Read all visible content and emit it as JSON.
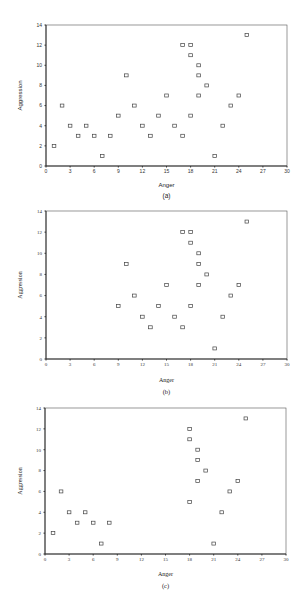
{
  "chart_data": [
    {
      "type": "scatter",
      "caption": "(a)",
      "title": "",
      "xlabel": "Anger",
      "ylabel": "Aggression",
      "xlim": [
        0,
        30
      ],
      "ylim": [
        0,
        14
      ],
      "xticks": [
        0,
        3,
        6,
        9,
        12,
        15,
        18,
        21,
        24,
        27,
        30
      ],
      "yticks": [
        0,
        2,
        4,
        6,
        8,
        10,
        12,
        14
      ],
      "grid": false,
      "marker": "open-square",
      "points": [
        [
          1,
          2
        ],
        [
          2,
          6
        ],
        [
          3,
          4
        ],
        [
          4,
          3
        ],
        [
          5,
          4
        ],
        [
          6,
          3
        ],
        [
          7,
          1
        ],
        [
          8,
          3
        ],
        [
          9,
          5
        ],
        [
          10,
          9
        ],
        [
          11,
          6
        ],
        [
          12,
          4
        ],
        [
          13,
          3
        ],
        [
          14,
          5
        ],
        [
          15,
          7
        ],
        [
          16,
          4
        ],
        [
          17,
          3
        ],
        [
          17,
          12
        ],
        [
          18,
          12
        ],
        [
          18,
          11
        ],
        [
          18,
          5
        ],
        [
          19,
          10
        ],
        [
          19,
          9
        ],
        [
          19,
          7
        ],
        [
          20,
          8
        ],
        [
          21,
          1
        ],
        [
          22,
          4
        ],
        [
          23,
          6
        ],
        [
          24,
          7
        ],
        [
          25,
          13
        ]
      ]
    },
    {
      "type": "scatter",
      "caption": "(b)",
      "title": "",
      "xlabel": "Anger",
      "ylabel": "Aggression",
      "xlim": [
        0,
        30
      ],
      "ylim": [
        0,
        14
      ],
      "xticks": [
        0,
        3,
        6,
        9,
        12,
        15,
        18,
        21,
        24,
        27,
        30
      ],
      "yticks": [
        0,
        2,
        4,
        6,
        8,
        10,
        12,
        14
      ],
      "grid": false,
      "marker": "open-square",
      "points": [
        [
          9,
          5
        ],
        [
          10,
          9
        ],
        [
          11,
          6
        ],
        [
          12,
          4
        ],
        [
          13,
          3
        ],
        [
          14,
          5
        ],
        [
          15,
          7
        ],
        [
          16,
          4
        ],
        [
          17,
          3
        ],
        [
          17,
          12
        ],
        [
          18,
          12
        ],
        [
          18,
          11
        ],
        [
          18,
          5
        ],
        [
          19,
          10
        ],
        [
          19,
          9
        ],
        [
          19,
          7
        ],
        [
          20,
          8
        ],
        [
          21,
          1
        ],
        [
          22,
          4
        ],
        [
          23,
          6
        ],
        [
          24,
          7
        ],
        [
          25,
          13
        ]
      ]
    },
    {
      "type": "scatter",
      "caption": "(c)",
      "title": "",
      "xlabel": "Anger",
      "ylabel": "Aggression",
      "xlim": [
        0,
        30
      ],
      "ylim": [
        0,
        14
      ],
      "xticks": [
        0,
        3,
        6,
        9,
        12,
        15,
        18,
        21,
        24,
        27,
        30
      ],
      "yticks": [
        0,
        2,
        4,
        6,
        8,
        10,
        12,
        14
      ],
      "grid": false,
      "marker": "open-square",
      "points": [
        [
          1,
          2
        ],
        [
          2,
          6
        ],
        [
          3,
          4
        ],
        [
          4,
          3
        ],
        [
          5,
          4
        ],
        [
          6,
          3
        ],
        [
          7,
          1
        ],
        [
          8,
          3
        ],
        [
          18,
          12
        ],
        [
          18,
          11
        ],
        [
          18,
          5
        ],
        [
          19,
          10
        ],
        [
          19,
          9
        ],
        [
          19,
          7
        ],
        [
          20,
          8
        ],
        [
          21,
          1
        ],
        [
          22,
          4
        ],
        [
          23,
          6
        ],
        [
          24,
          7
        ],
        [
          25,
          13
        ]
      ]
    }
  ],
  "layout": {
    "panels": [
      {
        "top": 0,
        "height": 205,
        "plot": {
          "x0": 46,
          "x1": 287,
          "y0": 166,
          "y1": 25
        },
        "font": "sans",
        "xlabel_y": 187,
        "caption_y": 198
      },
      {
        "top": 0,
        "height": 405,
        "plot": {
          "x0": 46,
          "x1": 287,
          "y0": 359,
          "y1": 211
        },
        "font": "serif",
        "xlabel_y": 382,
        "caption_y": 394
      },
      {
        "top": 0,
        "height": 612,
        "plot": {
          "x0": 45,
          "x1": 286,
          "y0": 554,
          "y1": 408
        },
        "font": "serif",
        "xlabel_y": 576,
        "caption_y": 588
      }
    ],
    "colors": {
      "axis": "#333333",
      "frame": "#555555",
      "marker": "#444444"
    }
  }
}
